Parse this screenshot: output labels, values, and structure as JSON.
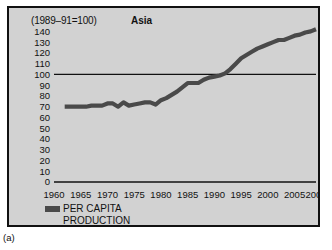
{
  "caption": "(a)",
  "header": {
    "index_note": "(1989–91=100)",
    "region_title": "Asia"
  },
  "legend": {
    "label": "PER CAPITA\nPRODUCTION",
    "swatch_color": "#4a4a4a"
  },
  "colors": {
    "panel_background": "#d2d2d2",
    "frame_border": "#111111",
    "series": "#4a4a4a",
    "axis": "#111111"
  },
  "chart_data": {
    "type": "line",
    "title": "Asia",
    "subtitle": "(1989–91=100)",
    "xlabel": "",
    "ylabel": "",
    "xlim": [
      1960,
      2009
    ],
    "ylim": [
      0,
      145
    ],
    "grid": false,
    "reference_line": 100,
    "ytick_labels": [
      140,
      130,
      120,
      110,
      100,
      90,
      80,
      70,
      60,
      50,
      40,
      30,
      20,
      10,
      0
    ],
    "xtick_labels": [
      1960,
      1965,
      1970,
      1975,
      1980,
      1985,
      1990,
      1995,
      2000,
      2005,
      2009
    ],
    "legend_position": "below-axis-left",
    "series": [
      {
        "name": "PER CAPITA PRODUCTION",
        "color": "#4a4a4a",
        "x": [
          1962,
          1963,
          1964,
          1965,
          1966,
          1967,
          1968,
          1969,
          1970,
          1971,
          1972,
          1973,
          1974,
          1975,
          1976,
          1977,
          1978,
          1979,
          1980,
          1981,
          1982,
          1983,
          1984,
          1985,
          1986,
          1987,
          1988,
          1989,
          1990,
          1991,
          1992,
          1993,
          1994,
          1995,
          1996,
          1997,
          1998,
          1999,
          2000,
          2001,
          2002,
          2003,
          2004,
          2005,
          2006,
          2007,
          2008,
          2009
        ],
        "values": [
          70,
          70,
          70,
          70,
          70,
          71,
          71,
          71,
          73,
          73,
          70,
          74,
          71,
          72,
          73,
          74,
          74,
          72,
          76,
          78,
          81,
          84,
          88,
          92,
          92,
          92,
          95,
          97,
          98,
          99,
          101,
          105,
          110,
          115,
          118,
          121,
          124,
          126,
          128,
          130,
          132,
          132,
          134,
          136,
          137,
          139,
          140,
          142
        ]
      }
    ]
  }
}
